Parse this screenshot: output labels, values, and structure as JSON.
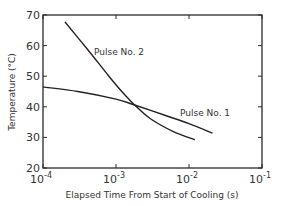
{
  "chart_data": {
    "type": "line",
    "title": "",
    "xlabel": "Elapsed Time From Start of Cooling (s)",
    "ylabel": "Temperature (°C)",
    "xscale": "log",
    "xlim": [
      0.0001,
      0.1
    ],
    "ylim": [
      20,
      70
    ],
    "xticks": [
      0.0001,
      0.001,
      0.01,
      0.1
    ],
    "xtick_labels": [
      {
        "base": "10",
        "exp": "-4"
      },
      {
        "base": "10",
        "exp": "-3"
      },
      {
        "base": "10",
        "exp": "-2"
      },
      {
        "base": "10",
        "exp": "-1"
      }
    ],
    "yticks": [
      20,
      30,
      40,
      50,
      60,
      70
    ],
    "ytick_labels": [
      "20",
      "30",
      "40",
      "50",
      "60",
      "70"
    ],
    "grid": false,
    "legend": "none (curves labeled inline)",
    "series": [
      {
        "name": "Pulse No. 1",
        "x": [
          0.0001,
          0.0003,
          0.001,
          0.0018,
          0.005,
          0.01,
          0.021
        ],
        "y": [
          46.5,
          45.0,
          42.5,
          40.6,
          37.0,
          34.5,
          31.4
        ]
      },
      {
        "name": "Pulse No. 2",
        "x": [
          0.0002,
          0.0004,
          0.0008,
          0.0012,
          0.0018,
          0.003,
          0.006,
          0.012
        ],
        "y": [
          67.7,
          59.0,
          50.0,
          45.0,
          40.6,
          36.0,
          32.0,
          29.2
        ]
      }
    ],
    "annotations": [
      {
        "text": "Pulse No. 2",
        "near": "upper curve, middle"
      },
      {
        "text": "Pulse No. 1",
        "near": "lower curve, right"
      }
    ]
  },
  "labels": {
    "xlabel": "Elapsed Time From Start of Cooling (s)",
    "ylabel": "Temperature (°C)",
    "pulse1": "Pulse No. 1",
    "pulse2": "Pulse No. 2"
  }
}
